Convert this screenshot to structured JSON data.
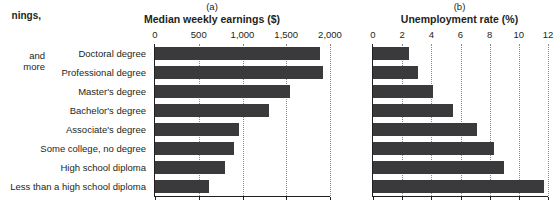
{
  "caption_fragments": {
    "line1": "nings,",
    "line2": "and",
    "line3": "more"
  },
  "panels": {
    "a": {
      "letter": "(a)",
      "title": "Median weekly earnings ($)"
    },
    "b": {
      "letter": "(b)",
      "title": "Unemployment rate (%)"
    }
  },
  "categories": [
    "Doctoral degree",
    "Professional degree",
    "Master's degree",
    "Bachelor's degree",
    "Associate's degree",
    "Some college, no degree",
    "High school diploma",
    "Less than a high school diploma"
  ],
  "axis_a_ticks": [
    "0",
    "500",
    "1,000",
    "1,500",
    "2,000"
  ],
  "axis_b_ticks": [
    "0",
    "2",
    "4",
    "6",
    "8",
    "10",
    "12"
  ],
  "colors": {
    "bar": "#3a3a3c",
    "text": "#231f20",
    "gridline": "#8a8a8a",
    "background": "#ffffff"
  },
  "chart_data": [
    {
      "type": "bar",
      "orientation": "horizontal",
      "panel": "(a)",
      "title": "Median weekly earnings ($)",
      "xlabel": "Median weekly earnings ($)",
      "ylabel": "",
      "categories": [
        "Doctoral degree",
        "Professional degree",
        "Master's degree",
        "Bachelor's degree",
        "Associate's degree",
        "Some college, no degree",
        "High school diploma",
        "Less than a high school diploma"
      ],
      "values": [
        1885,
        1924,
        1545,
        1305,
        963,
        899,
        802,
        619
      ],
      "xlim": [
        0,
        2000
      ],
      "xticks": [
        0,
        500,
        1000,
        1500,
        2000
      ],
      "xticklabels": [
        "0",
        "500",
        "1,000",
        "1,500",
        "2,000"
      ],
      "grid": true,
      "legend": "none"
    },
    {
      "type": "bar",
      "orientation": "horizontal",
      "panel": "(b)",
      "title": "Unemployment rate (%)",
      "xlabel": "Unemployment rate (%)",
      "ylabel": "",
      "categories": [
        "Doctoral degree",
        "Professional degree",
        "Master's degree",
        "Bachelor's degree",
        "Associate's degree",
        "Some college, no degree",
        "High school diploma",
        "Less than a high school diploma"
      ],
      "values": [
        2.5,
        3.1,
        4.1,
        5.5,
        7.1,
        8.3,
        9.0,
        11.7
      ],
      "xlim": [
        0,
        12
      ],
      "xticks": [
        0,
        2,
        4,
        6,
        8,
        10,
        12
      ],
      "xticklabels": [
        "0",
        "2",
        "4",
        "6",
        "8",
        "10",
        "12"
      ],
      "grid": true,
      "legend": "none"
    }
  ]
}
